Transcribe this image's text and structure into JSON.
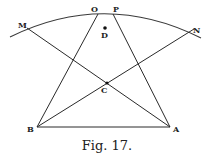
{
  "figure": {
    "caption": "Fig. 17.",
    "labels": {
      "M": "M",
      "N": "N",
      "O": "O",
      "P": "P",
      "D": "D",
      "C": "C",
      "B": "B",
      "A": "A"
    },
    "points": {
      "M": [
        27,
        28
      ],
      "N": [
        194,
        29
      ],
      "O": [
        98,
        14
      ],
      "P": [
        113,
        14
      ],
      "D": [
        105,
        28
      ],
      "C": [
        107,
        83
      ],
      "B": [
        37,
        127
      ],
      "A": [
        170,
        127
      ]
    },
    "arc": {
      "start": [
        10,
        37
      ],
      "peak": [
        105,
        13
      ],
      "end": [
        201,
        38
      ]
    },
    "segments": [
      [
        "B",
        "O"
      ],
      [
        "A",
        "P"
      ],
      [
        "M",
        "A"
      ],
      [
        "N",
        "B"
      ],
      [
        "B",
        "A"
      ]
    ],
    "line_color": "#2a2a2a"
  }
}
